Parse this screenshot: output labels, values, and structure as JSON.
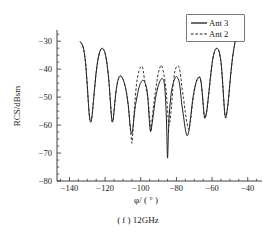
{
  "figure": {
    "caption": "( f ) 12GHz",
    "legend": {
      "entries": [
        {
          "label": "Ant 3",
          "style": "solid"
        },
        {
          "label": "Ant 2",
          "style": "dashed"
        }
      ]
    }
  },
  "chart_data": {
    "type": "line",
    "title": "",
    "subtitle": "",
    "caption": "( f ) 12GHz",
    "xlabel": "φ/ ( ° )",
    "ylabel": "RCS/dBsm",
    "xlim": [
      -147,
      -32
    ],
    "ylim": [
      -80,
      -26
    ],
    "xticks": [
      -140,
      -120,
      -100,
      -80,
      -60,
      -40
    ],
    "xticklabels": [
      "−140",
      "−120",
      "−100",
      "−80",
      "−60",
      "−40"
    ],
    "yticks": [
      -80,
      -70,
      -60,
      -50,
      -40,
      -30
    ],
    "yticklabels": [
      "−80",
      "−70",
      "−60",
      "−50",
      "−40",
      "−30"
    ],
    "xminor_step": 5,
    "yminor_step": 2.5,
    "grid": false,
    "legend_position": "top-right",
    "series": [
      {
        "name": "Ant 3",
        "style": "solid",
        "color": "#1c1c1c",
        "x": [
          -134.0,
          -133.0,
          -132.0,
          -131.0,
          -130.5,
          -130.0,
          -129.5,
          -129.0,
          -128.5,
          -128.0,
          -127.5,
          -127.0,
          -126.0,
          -125.0,
          -124.0,
          -123.0,
          -122.0,
          -121.0,
          -120.0,
          -119.0,
          -118.0,
          -117.5,
          -117.0,
          -116.5,
          -116.0,
          -115.5,
          -115.0,
          -114.0,
          -113.0,
          -112.0,
          -111.0,
          -110.0,
          -109.0,
          -108.0,
          -107.0,
          -106.5,
          -106.0,
          -105.5,
          -105.0,
          -104.5,
          -104.0,
          -103.5,
          -103.0,
          -102.0,
          -101.0,
          -100.0,
          -99.0,
          -98.0,
          -97.0,
          -96.5,
          -96.0,
          -95.5,
          -95.0,
          -94.5,
          -94.0,
          -93.0,
          -92.0,
          -91.0,
          -90.0,
          -89.0,
          -88.0,
          -87.0,
          -86.5,
          -86.0,
          -85.5,
          -85.0,
          -84.5,
          -84.0,
          -83.0,
          -82.0,
          -81.0,
          -80.0,
          -79.0,
          -78.5,
          -78.0,
          -77.5,
          -77.0,
          -76.0,
          -75.0,
          -74.0,
          -73.0,
          -72.0,
          -71.0,
          -70.0,
          -69.0,
          -68.0,
          -67.0,
          -66.5,
          -66.0,
          -65.5,
          -65.0,
          -64.5,
          -64.0,
          -63.0,
          -62.0,
          -61.0,
          -60.0,
          -59.0,
          -58.0,
          -57.0,
          -56.0,
          -55.0,
          -54.5,
          -54.0,
          -53.5,
          -53.0,
          -52.5,
          -52.0,
          -51.0,
          -50.0,
          -49.0,
          -48.0,
          -47.0
        ],
        "y": [
          -30.2,
          -31.0,
          -33.0,
          -37.5,
          -41.5,
          -46.0,
          -51.0,
          -55.5,
          -58.3,
          -58.8,
          -57.5,
          -54.5,
          -47.5,
          -41.0,
          -36.5,
          -33.8,
          -32.6,
          -32.8,
          -34.3,
          -37.8,
          -43.5,
          -47.5,
          -52.0,
          -56.5,
          -58.8,
          -58.0,
          -55.0,
          -48.5,
          -44.5,
          -42.6,
          -42.5,
          -43.5,
          -45.5,
          -48.5,
          -53.0,
          -56.5,
          -60.0,
          -62.5,
          -63.0,
          -61.5,
          -58.5,
          -55.5,
          -53.0,
          -49.5,
          -46.5,
          -44.8,
          -44.0,
          -44.4,
          -46.0,
          -47.5,
          -50.5,
          -55.5,
          -60.0,
          -62.2,
          -61.0,
          -56.5,
          -51.5,
          -48.0,
          -45.5,
          -44.0,
          -43.3,
          -44.5,
          -47.0,
          -52.0,
          -60.0,
          -71.8,
          -63.0,
          -56.0,
          -49.0,
          -45.5,
          -43.5,
          -42.6,
          -43.5,
          -44.5,
          -46.5,
          -49.5,
          -52.5,
          -57.0,
          -61.5,
          -63.8,
          -62.0,
          -57.0,
          -51.5,
          -47.5,
          -44.8,
          -43.2,
          -42.8,
          -43.5,
          -45.5,
          -48.5,
          -52.5,
          -56.0,
          -57.5,
          -55.0,
          -49.5,
          -43.5,
          -38.0,
          -34.5,
          -32.8,
          -32.6,
          -33.8,
          -37.5,
          -41.0,
          -45.5,
          -50.5,
          -55.0,
          -57.3,
          -56.5,
          -52.0,
          -45.0,
          -38.5,
          -33.5,
          -30.0
        ]
      },
      {
        "name": "Ant 2",
        "style": "dashed",
        "color": "#2a2a2a",
        "x": [
          -134.0,
          -133.0,
          -132.0,
          -131.0,
          -130.5,
          -130.0,
          -129.5,
          -129.0,
          -128.5,
          -128.0,
          -127.5,
          -127.0,
          -126.0,
          -125.0,
          -124.0,
          -123.0,
          -122.0,
          -121.0,
          -120.0,
          -119.0,
          -118.0,
          -117.5,
          -117.0,
          -116.5,
          -116.0,
          -115.5,
          -115.0,
          -114.0,
          -113.0,
          -112.0,
          -111.0,
          -110.0,
          -109.0,
          -108.0,
          -107.0,
          -106.5,
          -106.0,
          -105.5,
          -105.0,
          -104.5,
          -104.0,
          -103.5,
          -103.0,
          -102.5,
          -102.0,
          -101.0,
          -100.0,
          -99.5,
          -99.0,
          -98.5,
          -98.0,
          -97.0,
          -96.0,
          -95.5,
          -95.0,
          -94.5,
          -94.0,
          -93.0,
          -92.0,
          -91.0,
          -90.0,
          -89.0,
          -88.5,
          -88.0,
          -87.0,
          -86.0,
          -85.5,
          -85.0,
          -84.5,
          -84.0,
          -83.0,
          -82.5,
          -82.0,
          -81.5,
          -81.0,
          -80.0,
          -79.0,
          -78.5,
          -78.0,
          -77.5,
          -77.0,
          -76.0,
          -75.0,
          -74.0,
          -73.0,
          -72.0,
          -71.0,
          -70.0,
          -69.0,
          -68.0,
          -67.0,
          -66.5,
          -66.0,
          -65.5,
          -65.0,
          -64.5,
          -64.0,
          -63.0,
          -62.0,
          -61.0,
          -60.0,
          -59.0,
          -58.0,
          -57.0,
          -56.0,
          -55.0,
          -54.5,
          -54.0,
          -53.5,
          -53.0,
          -52.5,
          -52.0,
          -51.0,
          -50.0,
          -49.0,
          -48.0,
          -47.0
        ],
        "y": [
          -30.3,
          -31.1,
          -33.1,
          -37.6,
          -41.6,
          -46.1,
          -51.1,
          -55.6,
          -58.4,
          -58.9,
          -57.6,
          -54.6,
          -47.6,
          -41.1,
          -36.6,
          -33.9,
          -32.7,
          -32.9,
          -34.4,
          -37.9,
          -43.6,
          -47.6,
          -52.1,
          -56.6,
          -58.9,
          -58.1,
          -55.1,
          -48.6,
          -44.6,
          -42.7,
          -42.6,
          -43.6,
          -45.6,
          -48.6,
          -53.2,
          -56.8,
          -60.5,
          -63.5,
          -66.5,
          -63.0,
          -58.0,
          -53.5,
          -49.5,
          -46.0,
          -43.5,
          -40.5,
          -39.2,
          -38.9,
          -39.4,
          -41.0,
          -43.5,
          -47.0,
          -50.5,
          -53.5,
          -57.5,
          -62.5,
          -60.0,
          -54.0,
          -49.0,
          -44.5,
          -41.0,
          -39.0,
          -38.6,
          -39.2,
          -42.0,
          -46.5,
          -50.0,
          -54.5,
          -58.5,
          -60.0,
          -55.0,
          -51.0,
          -47.0,
          -43.5,
          -41.0,
          -39.2,
          -38.8,
          -39.3,
          -40.8,
          -43.0,
          -46.0,
          -50.5,
          -55.5,
          -59.5,
          -61.5,
          -58.0,
          -52.5,
          -48.0,
          -45.0,
          -43.4,
          -43.0,
          -43.7,
          -45.7,
          -48.7,
          -52.7,
          -56.2,
          -57.6,
          -55.1,
          -49.6,
          -43.6,
          -38.1,
          -34.6,
          -32.9,
          -32.7,
          -33.9,
          -37.6,
          -41.1,
          -45.6,
          -50.6,
          -55.1,
          -57.4,
          -56.6,
          -52.1,
          -45.1,
          -38.6,
          -33.6,
          -30.1
        ]
      }
    ],
    "annotations": []
  }
}
